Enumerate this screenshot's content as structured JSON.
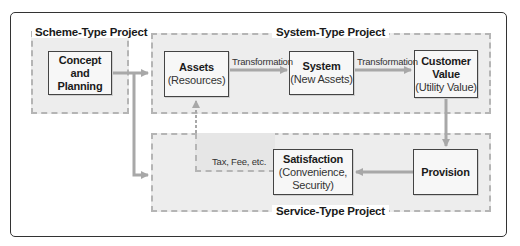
{
  "diagram": {
    "groups": {
      "scheme": {
        "label": "Scheme-Type Project"
      },
      "system": {
        "label": "System-Type Project"
      },
      "service": {
        "label": "Service-Type Project"
      }
    },
    "nodes": {
      "concept": {
        "title": "Concept and",
        "title2": "Planning"
      },
      "assets": {
        "title": "Assets",
        "subtitle": "(Resources)"
      },
      "system": {
        "title": "System",
        "subtitle": "(New Assets)"
      },
      "customer_value": {
        "title": "Customer",
        "title2": "Value",
        "subtitle": "(Utility Value)"
      },
      "provision": {
        "title": "Provision"
      },
      "satisfaction": {
        "title": "Satisfaction",
        "subtitle": "(Convenience,",
        "subtitle2": "Security)"
      }
    },
    "edges": {
      "assets_to_system": "Transformation",
      "system_to_value": "Transformation",
      "satisfaction_to_assets": "Tax, Fee, etc."
    },
    "colors": {
      "arrow": "#a8a8a8",
      "group_fill": "#ededed",
      "group_border": "#b5b5b5",
      "node_border": "#444444",
      "frame_border": "#333333"
    }
  }
}
